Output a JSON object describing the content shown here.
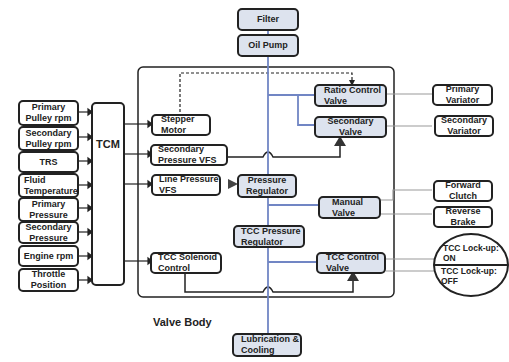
{
  "sensors": [
    {
      "id": "primary-pulley-rpm",
      "label": "Primary Pulley rpm"
    },
    {
      "id": "secondary-pulley-rpm",
      "label": "Secondary Pulley rpm"
    },
    {
      "id": "trs",
      "label": "TRS"
    },
    {
      "id": "fluid-temperature",
      "label": "Fluid Temperature"
    },
    {
      "id": "primary-pressure",
      "label": "Primary Pressure"
    },
    {
      "id": "secondary-pressure",
      "label": "Secondary Pressure"
    },
    {
      "id": "engine-rpm",
      "label": "Engine rpm"
    },
    {
      "id": "throttle-position",
      "label": "Throttle Position"
    }
  ],
  "tcm": {
    "label": "TCM"
  },
  "actuators": {
    "stepper_motor": "Stepper Motor",
    "secondary_pressure_vfs": "Secondary Pressure VFS",
    "line_pressure_vfs": "Line Pressure VFS",
    "tcc_solenoid_control": "TCC Solenoid Control"
  },
  "hydraulics": {
    "filter": "Filter",
    "oil_pump": "Oil Pump",
    "ratio_control_valve": "Ratio Control Valve",
    "secondary_valve": "Secondary Valve",
    "pressure_regulator": "Pressure Regulator",
    "manual_valve": "Manual Valve",
    "tcc_pressure_regulator": "TCC Pressure Regulator",
    "tcc_control_valve": "TCC Control Valve",
    "lubrication_cooling": "Lubrication & Cooling"
  },
  "outputs": {
    "primary_variator": "Primary Variator",
    "secondary_variator": "Secondary Variator",
    "forward_clutch": "Forward Clutch",
    "reverse_brake": "Reverse Brake",
    "tcc_lockup_on": "TCC Lock-up: ON",
    "tcc_lockup_off": "TCC Lock-up: OFF"
  },
  "valve_body_label": "Valve Body",
  "colors": {
    "flow_line": "#7186c4",
    "valve_fill": "#dde3ee",
    "stroke": "#222222"
  }
}
